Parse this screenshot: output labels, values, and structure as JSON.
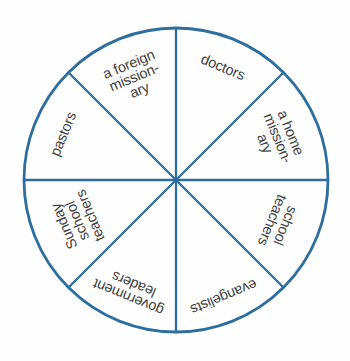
{
  "figure": {
    "type": "spinner-wheel",
    "sector_count": 8
  },
  "sectors": [
    {
      "id": "doctors",
      "label": "doctors",
      "lines": [
        "doctors"
      ]
    },
    {
      "id": "a-home-missionary",
      "label": "a home missionary",
      "lines": [
        "a home",
        "mission-",
        "ary"
      ]
    },
    {
      "id": "school-teachers",
      "label": "school teachers",
      "lines": [
        "school",
        "teachers"
      ]
    },
    {
      "id": "evangelists",
      "label": "evangelists",
      "lines": [
        "evangelists"
      ]
    },
    {
      "id": "government-leaders",
      "label": "government leaders",
      "lines": [
        "government",
        "leaders"
      ]
    },
    {
      "id": "sunday-school-teachers",
      "label": "Sunday school teachers",
      "lines": [
        "Sunday",
        "school",
        "teachers"
      ]
    },
    {
      "id": "pastors",
      "label": "pastors",
      "lines": [
        "pastors"
      ]
    },
    {
      "id": "a-foreign-missionary",
      "label": "a foreign missionary",
      "lines": [
        "a foreign",
        "mission-",
        "ary"
      ]
    }
  ],
  "colors": {
    "wheel_stroke": "#2e6e9f",
    "label_text": "#3f3f3f",
    "background": "#fefefe"
  }
}
